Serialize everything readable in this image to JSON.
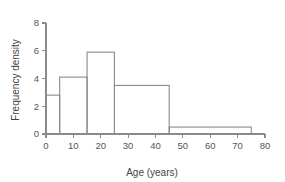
{
  "chart_data": {
    "type": "bar",
    "title": "",
    "subtitle": "",
    "xlabel": "Age (years)",
    "ylabel": "Frequency density",
    "xlim": [
      0,
      80
    ],
    "ylim": [
      0,
      8
    ],
    "xticks": [
      0,
      10,
      20,
      30,
      40,
      50,
      60,
      70,
      80
    ],
    "xtick_labels": [
      "0",
      "10",
      "20",
      "30",
      "40",
      "50",
      "60",
      "70",
      "80"
    ],
    "yticks": [
      0,
      2,
      4,
      6,
      8
    ],
    "ytick_labels": [
      "0",
      "2",
      "4",
      "6",
      "8"
    ],
    "grid": false,
    "legend": false,
    "legend_position": "none",
    "bar_fill": "#ffffff",
    "bar_stroke": "#8a8a8a",
    "axis_color": "#8a8a8a",
    "background": "#ffffff",
    "histogram": true,
    "bin_edges": [
      0,
      5,
      15,
      25,
      45,
      75
    ],
    "categories": [
      "0-5",
      "5-15",
      "15-25",
      "25-45",
      "45-75"
    ],
    "values": [
      2.8,
      4.1,
      5.9,
      3.5,
      0.5
    ],
    "bars": [
      {
        "label": "0-5",
        "x0": 0,
        "x1": 5,
        "height": 2.8
      },
      {
        "label": "5-15",
        "x0": 5,
        "x1": 15,
        "height": 4.1
      },
      {
        "label": "15-25",
        "x0": 15,
        "x1": 25,
        "height": 5.9
      },
      {
        "label": "25-45",
        "x0": 25,
        "x1": 45,
        "height": 3.5
      },
      {
        "label": "45-75",
        "x0": 45,
        "x1": 75,
        "height": 0.5
      }
    ]
  }
}
